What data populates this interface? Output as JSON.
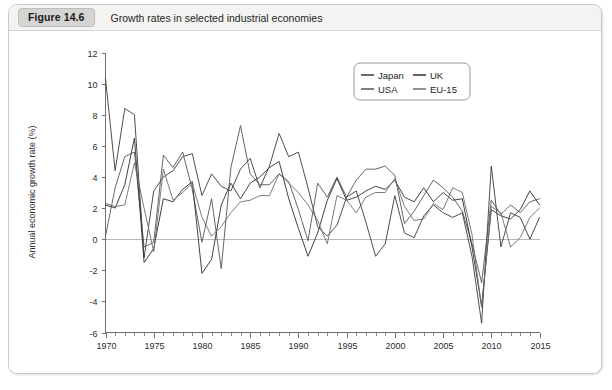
{
  "figure": {
    "badge": "Figure 14.6",
    "title": "Growth rates in selected industrial economies"
  },
  "chart_data": {
    "type": "line",
    "title": "Growth rates in selected industrial economies",
    "xlabel": "",
    "ylabel": "Annual economic growth rate (%)",
    "xlim": [
      1970,
      2015
    ],
    "ylim": [
      -6,
      12
    ],
    "grid": false,
    "zero_line": true,
    "legend_position": "top-right-inside",
    "x_tick_labels": [
      "1970",
      "1975",
      "1980",
      "1985",
      "1990",
      "1995",
      "2000",
      "2005",
      "2010",
      "2015"
    ],
    "x_ticks": [
      1970,
      1975,
      1980,
      1985,
      1990,
      1995,
      2000,
      2005,
      2010,
      2015
    ],
    "x_minor_step": 1,
    "y_tick_labels": [
      "12",
      "10",
      "8",
      "6",
      "4",
      "2",
      "0",
      "-2",
      "-4",
      "-6"
    ],
    "y_ticks": [
      12,
      10,
      8,
      6,
      4,
      2,
      0,
      -2,
      -4,
      -6
    ],
    "x": [
      1970,
      1971,
      1972,
      1973,
      1974,
      1975,
      1976,
      1977,
      1978,
      1979,
      1980,
      1981,
      1982,
      1983,
      1984,
      1985,
      1986,
      1987,
      1988,
      1989,
      1990,
      1991,
      1992,
      1993,
      1994,
      1995,
      1996,
      1997,
      1998,
      1999,
      2000,
      2001,
      2002,
      2003,
      2004,
      2005,
      2006,
      2007,
      2008,
      2009,
      2010,
      2011,
      2012,
      2013,
      2014,
      2015
    ],
    "series": [
      {
        "name": "Japan",
        "color": "#3a3a3a",
        "values": [
          10.3,
          4.4,
          8.4,
          8.0,
          -1.2,
          3.1,
          4.0,
          4.4,
          5.3,
          5.5,
          2.8,
          4.2,
          3.4,
          3.1,
          4.5,
          5.2,
          3.3,
          4.7,
          6.8,
          5.3,
          5.6,
          3.3,
          0.8,
          0.2,
          0.9,
          2.7,
          3.1,
          1.1,
          -1.1,
          -0.3,
          2.8,
          0.4,
          0.1,
          1.5,
          2.2,
          1.7,
          1.4,
          1.7,
          -1.1,
          -5.4,
          4.7,
          -0.5,
          1.7,
          1.4,
          0.0,
          1.4
        ]
      },
      {
        "name": "USA",
        "color": "#555555",
        "values": [
          0.2,
          3.3,
          5.3,
          5.6,
          -0.5,
          -0.2,
          5.4,
          4.6,
          5.6,
          3.2,
          -0.2,
          2.6,
          -1.9,
          4.6,
          7.3,
          4.2,
          3.5,
          3.5,
          4.2,
          3.7,
          1.9,
          -0.1,
          3.6,
          2.7,
          4.0,
          2.7,
          3.8,
          4.5,
          4.5,
          4.7,
          4.1,
          1.0,
          1.8,
          2.8,
          3.8,
          3.3,
          2.7,
          1.8,
          -0.3,
          -2.8,
          2.5,
          1.6,
          2.2,
          1.7,
          2.4,
          2.6
        ]
      },
      {
        "name": "UK",
        "color": "#2e2e2e",
        "values": [
          2.2,
          2.0,
          3.5,
          6.5,
          -1.5,
          -0.6,
          2.6,
          2.4,
          3.2,
          3.7,
          -2.2,
          -1.3,
          2.2,
          3.6,
          2.6,
          3.6,
          4.0,
          4.6,
          5.0,
          2.6,
          0.7,
          -1.1,
          0.4,
          2.5,
          3.9,
          2.5,
          2.7,
          3.1,
          3.4,
          3.2,
          3.8,
          2.7,
          2.4,
          3.3,
          2.4,
          3.0,
          2.5,
          2.6,
          -0.5,
          -4.3,
          1.9,
          1.5,
          1.3,
          1.9,
          3.1,
          2.2
        ]
      },
      {
        "name": "EU-15",
        "color": "#6d6d6d",
        "values": [
          2.3,
          2.1,
          2.2,
          4.9,
          2.0,
          -0.8,
          4.5,
          2.5,
          3.0,
          3.6,
          1.4,
          0.2,
          0.8,
          1.7,
          2.4,
          2.5,
          2.8,
          2.8,
          4.2,
          3.6,
          3.0,
          2.2,
          1.2,
          -0.3,
          2.8,
          2.5,
          1.7,
          2.7,
          3.0,
          3.0,
          3.9,
          2.1,
          1.2,
          1.3,
          2.3,
          1.9,
          3.3,
          3.0,
          0.3,
          -4.4,
          2.1,
          1.7,
          -0.5,
          0.1,
          1.4,
          2.0
        ]
      }
    ]
  },
  "legend": {
    "entries": [
      {
        "label": "Japan"
      },
      {
        "label": "UK"
      },
      {
        "label": "USA"
      },
      {
        "label": "EU-15"
      }
    ]
  }
}
